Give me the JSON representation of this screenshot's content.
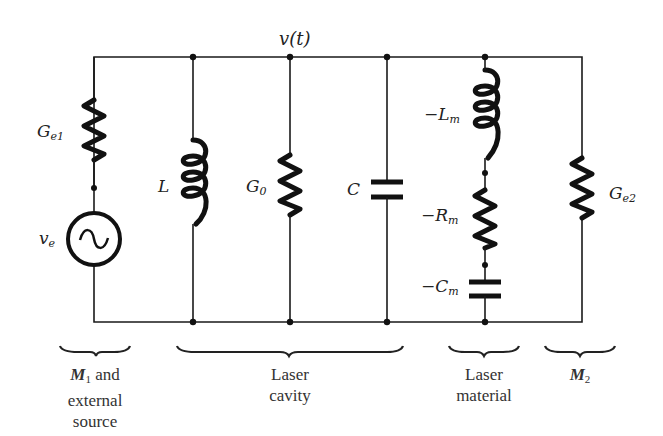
{
  "diagram": {
    "node_label": "v(t)",
    "components": {
      "Ge1": {
        "main": "G",
        "sub": "e1",
        "label": "G_e1"
      },
      "ve": {
        "main": "v",
        "sub": "e",
        "label": "v_e"
      },
      "L": {
        "label": "L"
      },
      "G0": {
        "main": "G",
        "sub": "0",
        "label": "G_0"
      },
      "C": {
        "label": "C"
      },
      "Lm": {
        "main": "−L",
        "sub": "m",
        "label": "−L_m"
      },
      "Rm": {
        "main": "−R",
        "sub": "m",
        "label": "−R_m"
      },
      "Cm": {
        "main": "−C",
        "sub": "m",
        "label": "−C_m"
      },
      "Ge2": {
        "main": "G",
        "sub": "e2",
        "label": "G_e2"
      }
    },
    "groups": [
      {
        "id": "m1",
        "main": "M",
        "sub": "1",
        "line1_rest": " and",
        "line2": "external",
        "line3": "source"
      },
      {
        "id": "cavity",
        "line1": "Laser",
        "line2": "cavity"
      },
      {
        "id": "material",
        "line1": "Laser",
        "line2": "material"
      },
      {
        "id": "m2",
        "main": "M",
        "sub": "2"
      }
    ],
    "colors": {
      "ink": "#111111",
      "background": "#ffffff"
    }
  }
}
